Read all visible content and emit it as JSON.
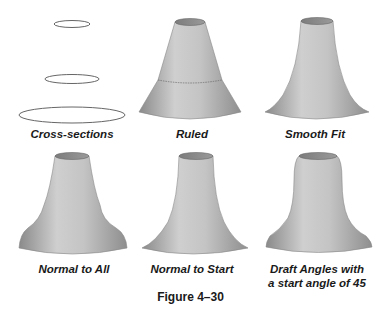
{
  "figure": {
    "caption": "Figure 4–30",
    "panels": [
      {
        "id": "cross-sections",
        "label": "Cross-sections"
      },
      {
        "id": "ruled",
        "label": "Ruled"
      },
      {
        "id": "smooth-fit",
        "label": "Smooth Fit"
      },
      {
        "id": "normal-to-all",
        "label": "Normal to All"
      },
      {
        "id": "normal-to-start",
        "label": "Normal to Start"
      },
      {
        "id": "draft-angles",
        "label_line1": "Draft Angles with",
        "label_line2": "a start angle of 45"
      }
    ],
    "colors": {
      "surface_light": "#d4d4d4",
      "surface_mid": "#a8a8a8",
      "surface_dark": "#7a7a7a",
      "top_face": "#8c8c8c",
      "outline": "#555555",
      "text": "#1a1a1a"
    }
  }
}
